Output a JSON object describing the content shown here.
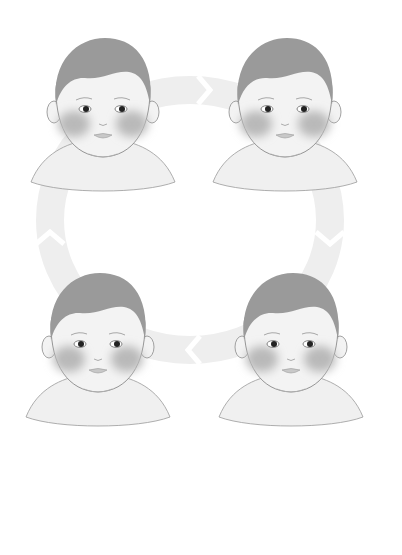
{
  "illustration": {
    "title": "",
    "background": "#ffffff",
    "cycle": {
      "direction": "clockwise",
      "ring_color": "#eeeeee",
      "arrows": [
        {
          "position": "top",
          "points": "right"
        },
        {
          "position": "right",
          "points": "down"
        },
        {
          "position": "bottom",
          "points": "left"
        },
        {
          "position": "left",
          "points": "up"
        }
      ]
    },
    "faces": [
      {
        "position": "top-left",
        "expression": "smiling, eyes looking right",
        "cheek_blush": true
      },
      {
        "position": "top-right",
        "expression": "calm smile, eyes forward",
        "cheek_blush": true
      },
      {
        "position": "bottom-right",
        "expression": "calm smile, eyes forward",
        "cheek_blush": true
      },
      {
        "position": "bottom-left",
        "expression": "smiling, eyes looking right",
        "cheek_blush": true
      }
    ],
    "colors": {
      "hair": "#9a9a9a",
      "skin": "#f3f3f3",
      "outline": "#8a8a8a",
      "blush": "#b9b9b9",
      "eye": "#222222",
      "body": "#f0f0f0"
    }
  }
}
